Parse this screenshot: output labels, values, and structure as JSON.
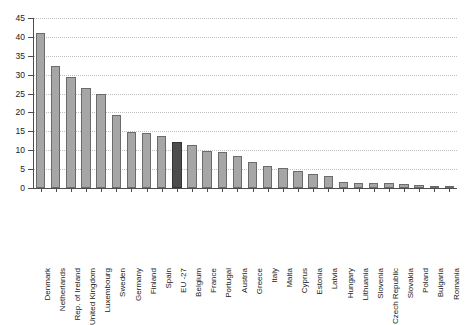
{
  "chart_data": {
    "type": "bar",
    "title": "",
    "subtitle": "",
    "xlabel": "",
    "ylabel": "",
    "ylim": [
      0,
      45
    ],
    "yticks": [
      0,
      5,
      10,
      15,
      20,
      25,
      30,
      35,
      40,
      45
    ],
    "grid": true,
    "legend": "none",
    "highlight_category": "EU -27",
    "colors": {
      "bar": "#a6a6a6",
      "bar_edge": "#6b6b6b",
      "highlight_bar": "#4d4d4d",
      "highlight_bar_edge": "#333333",
      "grid": "#bfbfbf",
      "axis": "#4d4d4d",
      "text": "#1a1a1a",
      "background": "#ffffff"
    },
    "categories": [
      "Denmark",
      "Netherlands",
      "Rep. of Ireland",
      "United Kingdom",
      "Luxembourg",
      "Sweden",
      "Germany",
      "Finland",
      "Spain",
      "EU -27",
      "Belgium",
      "France",
      "Portugal",
      "Austria",
      "Greece",
      "Italy",
      "Malta",
      "Cyprus",
      "Estonia",
      "Latvia",
      "Hungary",
      "Lithuania",
      "Slovenia",
      "Czech Republic",
      "Slovakia",
      "Poland",
      "Bulgaria",
      "Romania"
    ],
    "values": [
      41.0,
      32.4,
      29.4,
      26.4,
      25.0,
      19.4,
      14.8,
      14.5,
      13.8,
      12.3,
      11.5,
      9.9,
      9.5,
      8.4,
      6.8,
      5.8,
      5.3,
      4.6,
      3.8,
      3.3,
      1.5,
      1.4,
      1.3,
      1.2,
      1.1,
      0.8,
      0.6,
      0.5
    ]
  }
}
